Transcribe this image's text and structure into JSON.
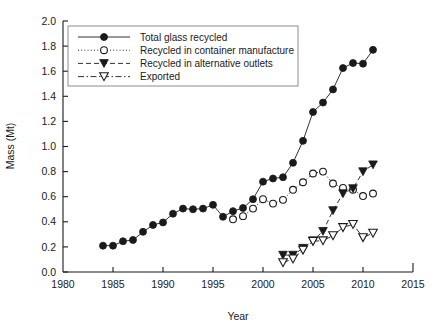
{
  "chart_data": {
    "type": "line",
    "title": "",
    "xlabel": "Year",
    "ylabel": "Mass (Mt)",
    "xlim": [
      1980,
      2015
    ],
    "ylim": [
      0.0,
      2.0
    ],
    "xticks": [
      1980,
      1985,
      1990,
      1995,
      2000,
      2005,
      2010,
      2015
    ],
    "yticks": [
      0.0,
      0.2,
      0.4,
      0.6,
      0.8,
      1.0,
      1.2,
      1.4,
      1.6,
      1.8,
      2.0
    ],
    "xtick_labels": [
      "1980",
      "1985",
      "1990",
      "1995",
      "2000",
      "2005",
      "2010",
      "2015"
    ],
    "ytick_labels": [
      "0.0",
      "0.2",
      "0.4",
      "0.6",
      "0.8",
      "1.0",
      "1.2",
      "1.4",
      "1.6",
      "1.8",
      "2.0"
    ],
    "grid": false,
    "legend_position": "upper-left",
    "series": [
      {
        "name": "Total glass recycled",
        "marker": "filled-circle",
        "linestyle": "solid",
        "color": "#1a1a1a",
        "x": [
          1984,
          1985,
          1986,
          1987,
          1988,
          1989,
          1990,
          1991,
          1992,
          1993,
          1994,
          1995,
          1996,
          1997,
          1998,
          1999,
          2000,
          2001,
          2002,
          2003,
          2004,
          2005,
          2006,
          2007,
          2008,
          2009,
          2010,
          2011
        ],
        "values": [
          0.21,
          0.21,
          0.245,
          0.255,
          0.32,
          0.375,
          0.395,
          0.465,
          0.505,
          0.5,
          0.505,
          0.535,
          0.44,
          0.485,
          0.51,
          0.58,
          0.72,
          0.745,
          0.755,
          0.87,
          1.045,
          1.275,
          1.35,
          1.455,
          1.625,
          1.665,
          1.66,
          1.77
        ]
      },
      {
        "name": "Recycled in container manufacture",
        "marker": "open-circle",
        "linestyle": "dotted",
        "color": "#1a1a1a",
        "x": [
          1997,
          1998,
          1999,
          2000,
          2001,
          2002,
          2003,
          2004,
          2005,
          2006,
          2007,
          2008,
          2009,
          2010,
          2011
        ],
        "values": [
          0.42,
          0.445,
          0.505,
          0.58,
          0.545,
          0.575,
          0.655,
          0.715,
          0.785,
          0.8,
          0.705,
          0.67,
          0.655,
          0.605,
          0.625
        ]
      },
      {
        "name": "Recycled in alternative outlets",
        "marker": "filled-triangle-down",
        "linestyle": "dashed",
        "color": "#1a1a1a",
        "x": [
          2002,
          2003,
          2004,
          2005,
          2006,
          2007,
          2008,
          2009,
          2010,
          2011
        ],
        "values": [
          0.135,
          0.135,
          0.19,
          0.25,
          0.325,
          0.49,
          0.625,
          0.665,
          0.8,
          0.855
        ]
      },
      {
        "name": "Exported",
        "marker": "open-triangle-down",
        "linestyle": "dash-dot",
        "color": "#1a1a1a",
        "x": [
          2002,
          2003,
          2004,
          2005,
          2006,
          2007,
          2008,
          2009,
          2010,
          2011
        ],
        "values": [
          0.075,
          0.105,
          0.175,
          0.245,
          0.25,
          0.29,
          0.355,
          0.38,
          0.275,
          0.31
        ]
      }
    ]
  }
}
